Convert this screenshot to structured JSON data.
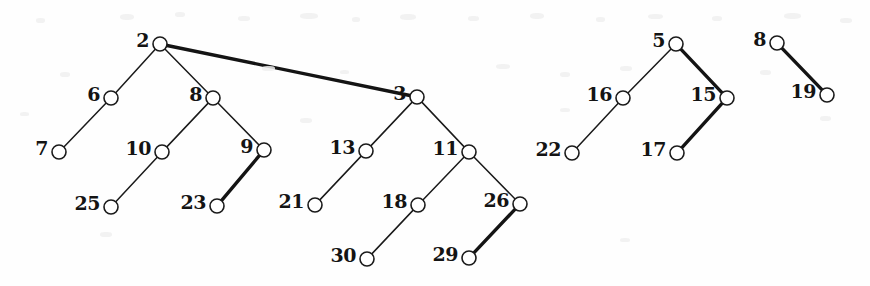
{
  "figure": {
    "type": "forest-of-binary-trees",
    "width": 870,
    "height": 286,
    "background_color": "#fefefe",
    "ink_color": "#141414",
    "node_radius": 7,
    "caption": ""
  },
  "nodes": [
    {
      "id": "n2",
      "label": "2",
      "x": 160,
      "y": 44,
      "tree": 1
    },
    {
      "id": "n6",
      "label": "6",
      "x": 111,
      "y": 98,
      "tree": 1
    },
    {
      "id": "n8a",
      "label": "8",
      "x": 213,
      "y": 98,
      "tree": 1
    },
    {
      "id": "n7",
      "label": "7",
      "x": 59,
      "y": 152,
      "tree": 1
    },
    {
      "id": "n10",
      "label": "10",
      "x": 162,
      "y": 152,
      "tree": 1
    },
    {
      "id": "n9",
      "label": "9",
      "x": 264,
      "y": 150,
      "tree": 1
    },
    {
      "id": "n25",
      "label": "25",
      "x": 111,
      "y": 207,
      "tree": 1
    },
    {
      "id": "n23",
      "label": "23",
      "x": 217,
      "y": 206,
      "tree": 1
    },
    {
      "id": "n3",
      "label": "3",
      "x": 417,
      "y": 97,
      "tree": 1
    },
    {
      "id": "n13",
      "label": "13",
      "x": 366,
      "y": 151,
      "tree": 1
    },
    {
      "id": "n11",
      "label": "11",
      "x": 469,
      "y": 152,
      "tree": 1
    },
    {
      "id": "n21",
      "label": "21",
      "x": 315,
      "y": 205,
      "tree": 1
    },
    {
      "id": "n18",
      "label": "18",
      "x": 418,
      "y": 205,
      "tree": 1
    },
    {
      "id": "n26",
      "label": "26",
      "x": 520,
      "y": 204,
      "tree": 1
    },
    {
      "id": "n30",
      "label": "30",
      "x": 367,
      "y": 259,
      "tree": 1
    },
    {
      "id": "n29",
      "label": "29",
      "x": 469,
      "y": 258,
      "tree": 1
    },
    {
      "id": "n5",
      "label": "5",
      "x": 676,
      "y": 44,
      "tree": 2
    },
    {
      "id": "n16",
      "label": "16",
      "x": 623,
      "y": 98,
      "tree": 2
    },
    {
      "id": "n15",
      "label": "15",
      "x": 727,
      "y": 98,
      "tree": 2
    },
    {
      "id": "n22",
      "label": "22",
      "x": 572,
      "y": 153,
      "tree": 2
    },
    {
      "id": "n17",
      "label": "17",
      "x": 677,
      "y": 153,
      "tree": 2
    },
    {
      "id": "n8b",
      "label": "8",
      "x": 777,
      "y": 43,
      "tree": 3
    },
    {
      "id": "n19",
      "label": "19",
      "x": 827,
      "y": 95,
      "tree": 3
    }
  ],
  "edges": [
    {
      "from": "n2",
      "to": "n6",
      "weight": "thin"
    },
    {
      "from": "n2",
      "to": "n8a",
      "weight": "thin"
    },
    {
      "from": "n2",
      "to": "n3",
      "weight": "thick"
    },
    {
      "from": "n6",
      "to": "n7",
      "weight": "thin"
    },
    {
      "from": "n8a",
      "to": "n10",
      "weight": "thin"
    },
    {
      "from": "n8a",
      "to": "n9",
      "weight": "thin"
    },
    {
      "from": "n10",
      "to": "n25",
      "weight": "thin"
    },
    {
      "from": "n9",
      "to": "n23",
      "weight": "thick"
    },
    {
      "from": "n3",
      "to": "n13",
      "weight": "thin"
    },
    {
      "from": "n3",
      "to": "n11",
      "weight": "thin"
    },
    {
      "from": "n13",
      "to": "n21",
      "weight": "thin"
    },
    {
      "from": "n11",
      "to": "n18",
      "weight": "thin"
    },
    {
      "from": "n11",
      "to": "n26",
      "weight": "thin"
    },
    {
      "from": "n18",
      "to": "n30",
      "weight": "thin"
    },
    {
      "from": "n26",
      "to": "n29",
      "weight": "thick"
    },
    {
      "from": "n5",
      "to": "n16",
      "weight": "thin"
    },
    {
      "from": "n5",
      "to": "n15",
      "weight": "thick"
    },
    {
      "from": "n16",
      "to": "n22",
      "weight": "thin"
    },
    {
      "from": "n15",
      "to": "n17",
      "weight": "thick"
    },
    {
      "from": "n8b",
      "to": "n19",
      "weight": "thick"
    }
  ],
  "specks": [
    {
      "x": 36,
      "y": 18,
      "w": 9,
      "h": 5
    },
    {
      "x": 120,
      "y": 14,
      "w": 14,
      "h": 6
    },
    {
      "x": 175,
      "y": 12,
      "w": 10,
      "h": 5
    },
    {
      "x": 238,
      "y": 16,
      "w": 12,
      "h": 5
    },
    {
      "x": 300,
      "y": 13,
      "w": 18,
      "h": 6
    },
    {
      "x": 352,
      "y": 17,
      "w": 8,
      "h": 5
    },
    {
      "x": 400,
      "y": 14,
      "w": 16,
      "h": 6
    },
    {
      "x": 468,
      "y": 16,
      "w": 11,
      "h": 5
    },
    {
      "x": 530,
      "y": 13,
      "w": 14,
      "h": 6
    },
    {
      "x": 596,
      "y": 17,
      "w": 9,
      "h": 5
    },
    {
      "x": 648,
      "y": 14,
      "w": 15,
      "h": 5
    },
    {
      "x": 712,
      "y": 16,
      "w": 10,
      "h": 5
    },
    {
      "x": 784,
      "y": 13,
      "w": 17,
      "h": 6
    },
    {
      "x": 840,
      "y": 18,
      "w": 12,
      "h": 5
    },
    {
      "x": 60,
      "y": 72,
      "w": 10,
      "h": 5
    },
    {
      "x": 262,
      "y": 66,
      "w": 13,
      "h": 5
    },
    {
      "x": 340,
      "y": 70,
      "w": 9,
      "h": 4
    },
    {
      "x": 496,
      "y": 64,
      "w": 14,
      "h": 5
    },
    {
      "x": 560,
      "y": 72,
      "w": 10,
      "h": 5
    },
    {
      "x": 620,
      "y": 66,
      "w": 12,
      "h": 5
    },
    {
      "x": 760,
      "y": 70,
      "w": 11,
      "h": 5
    },
    {
      "x": 20,
      "y": 112,
      "w": 9,
      "h": 4
    },
    {
      "x": 300,
      "y": 118,
      "w": 12,
      "h": 5
    },
    {
      "x": 560,
      "y": 108,
      "w": 10,
      "h": 4
    },
    {
      "x": 820,
      "y": 116,
      "w": 11,
      "h": 5
    },
    {
      "x": 100,
      "y": 232,
      "w": 12,
      "h": 5
    },
    {
      "x": 620,
      "y": 238,
      "w": 10,
      "h": 4
    }
  ]
}
